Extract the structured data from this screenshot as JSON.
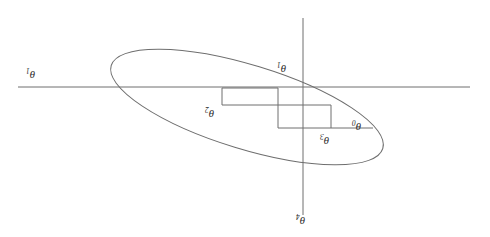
{
  "figure": {
    "type": "diagram",
    "width": 490,
    "height": 237,
    "background_color": "#ffffff",
    "line_color": "#6e6e6e",
    "label_color": "#2b2b2b",
    "label_orientation": "rotated-180"
  },
  "axes": {
    "horizontal": {
      "name": "horizontal-axis",
      "y": 87,
      "x_start": 18,
      "x_end": 470,
      "label": "θ",
      "label_sub": "1",
      "label_x": 26,
      "label_y": 66
    },
    "vertical": {
      "name": "vertical-axis",
      "x": 303,
      "y_start": 18,
      "y_end": 215,
      "label": "θ",
      "label_sub": "4",
      "label_x": 296,
      "label_y": 212
    }
  },
  "contour": {
    "name": "contour-ellipse",
    "center_x": 247,
    "center_y": 107,
    "radius_x": 142,
    "radius_y": 42,
    "rotation_deg": 17
  },
  "path": {
    "name": "descent-path",
    "description": "staircase / coordinate-descent step path",
    "points": [
      {
        "x": 373,
        "y": 128
      },
      {
        "x": 331,
        "y": 128
      },
      {
        "x": 331,
        "y": 105
      },
      {
        "x": 278,
        "y": 105
      },
      {
        "x": 278,
        "y": 88
      },
      {
        "x": 222,
        "y": 88
      },
      {
        "x": 222,
        "y": 105
      },
      {
        "x": 278,
        "y": 105
      },
      {
        "x": 278,
        "y": 128
      },
      {
        "x": 331,
        "y": 128
      }
    ]
  },
  "labels": [
    {
      "name": "label-theta-1",
      "base": "θ",
      "sub": "1",
      "x": 26,
      "y": 66
    },
    {
      "name": "label-theta-2",
      "base": "θ",
      "sub": "2",
      "x": 205,
      "y": 105
    },
    {
      "name": "label-theta-3",
      "base": "θ",
      "sub": "3",
      "x": 320,
      "y": 132
    },
    {
      "name": "label-theta-0",
      "base": "θ",
      "sub": "0",
      "x": 352,
      "y": 118
    },
    {
      "name": "label-theta-top",
      "base": "θ",
      "sub": "1",
      "x": 277,
      "y": 60
    },
    {
      "name": "label-theta-4",
      "base": "θ",
      "sub": "4",
      "x": 296,
      "y": 212
    }
  ]
}
